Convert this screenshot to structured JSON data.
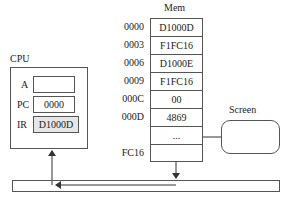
{
  "cpu": {
    "title": "CPU",
    "registers": [
      {
        "name": "A",
        "value": ""
      },
      {
        "name": "PC",
        "value": "0000"
      },
      {
        "name": "IR",
        "value": "D1000D",
        "highlighted": true
      }
    ]
  },
  "memory": {
    "title": "Mem",
    "rows": [
      {
        "address": "0000",
        "value": "D1000D"
      },
      {
        "address": "0003",
        "value": "F1FC16"
      },
      {
        "address": "0006",
        "value": "D1000E"
      },
      {
        "address": "0009",
        "value": "F1FC16"
      },
      {
        "address": "000C",
        "value": "00"
      },
      {
        "address": "000D",
        "value": "4869"
      },
      {
        "address": "",
        "value": "..."
      },
      {
        "address": "FC16",
        "value": ""
      }
    ]
  },
  "screen": {
    "title": "Screen"
  },
  "bus": {
    "direction": "right-to-left"
  },
  "colors": {
    "line": "#444444",
    "ir_fill": "#e6e6e6"
  }
}
